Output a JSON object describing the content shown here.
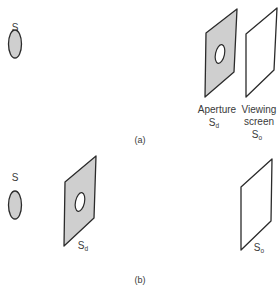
{
  "figure": {
    "panels": [
      {
        "id": "a",
        "label": "(a)",
        "source_label": "S",
        "aperture_label": "Aperture",
        "aperture_symbol": "S",
        "aperture_subscript": "d",
        "screen_label_line1": "Viewing",
        "screen_label_line2": "screen",
        "screen_symbol": "S",
        "screen_subscript": "o"
      },
      {
        "id": "b",
        "label": "(b)",
        "source_label": "S",
        "aperture_symbol": "S",
        "aperture_subscript": "d",
        "screen_symbol": "S",
        "screen_subscript": "o"
      }
    ],
    "colors": {
      "stroke": "#2b2b2b",
      "fill_shaded": "#cfcfcf",
      "background": "#ffffff",
      "text": "#3a3a3a"
    }
  }
}
